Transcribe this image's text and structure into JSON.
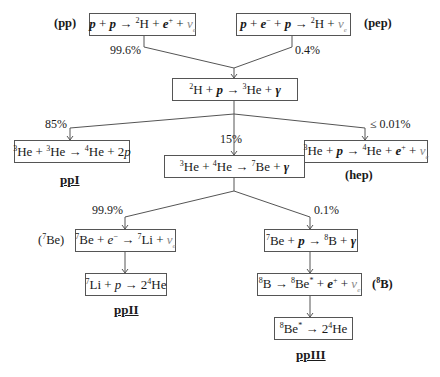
{
  "diagram": {
    "boxes": {
      "pp": {
        "lhs": "p + p",
        "rhs": "²H + e⁺ + νe"
      },
      "pep": {
        "lhs": "p + e⁻ + p",
        "rhs": "²H + νe"
      },
      "deuterium_capture": {
        "lhs": "²H + p",
        "rhs": "³He + γ"
      },
      "ppI": {
        "lhs": "³He + ³He",
        "rhs": "⁴He + 2p"
      },
      "he3_he4": {
        "lhs": "³He + ⁴He",
        "rhs": "⁷Be + γ"
      },
      "hep": {
        "lhs": "³He + p",
        "rhs": "⁴He + e⁺ + νe"
      },
      "be7_ec": {
        "lhs": "⁷Be + e⁻",
        "rhs": "⁷Li + νe"
      },
      "be7_p": {
        "lhs": "⁷Be + p",
        "rhs": "⁸B + γ"
      },
      "li7_p": {
        "lhs": "⁷Li + p",
        "rhs": "2⁴He"
      },
      "b8_decay": {
        "lhs": "⁸B",
        "rhs": "⁸Be* + e⁺ + νe"
      },
      "be8_decay": {
        "lhs": "⁸Be*",
        "rhs": "2⁴He"
      }
    },
    "tags": {
      "pp": "(pp)",
      "pep": "(pep)",
      "hep": "(hep)",
      "be7_pre": "(",
      "be7_sup": "7",
      "be7_post": "Be)",
      "b8_pre": "(",
      "b8_sup": "8",
      "b8_post": "B)"
    },
    "percentages": {
      "pp": "99.6%",
      "pep": "0.4%",
      "ppI": "85%",
      "ppII_III": "15%",
      "hep": "≤ 0.01%",
      "ppII": "99.9%",
      "ppIII": "0.1%"
    },
    "chains": {
      "ppI": "ppI",
      "ppII": "ppII",
      "ppIII": "ppIII"
    },
    "colors": {
      "line": "#555555",
      "neutrino": "#8a8a8a",
      "text": "#1a1a1a"
    }
  }
}
